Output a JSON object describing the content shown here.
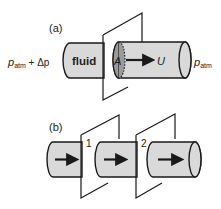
{
  "figure": {
    "panel_a": {
      "label": "(a)",
      "left_pressure": {
        "symbol": "p",
        "subscript": "atm",
        "suffix": " + Δp"
      },
      "right_pressure": {
        "symbol": "p",
        "subscript": "atm"
      },
      "fluid_label": "fluid",
      "area_label": "A",
      "velocity_label": "U"
    },
    "panel_b": {
      "label": "(b)",
      "plane_labels": [
        "1",
        "2"
      ]
    },
    "colors": {
      "tube_fill": "#d9d9d9",
      "cross_section_fill": "#9a9a9a",
      "stroke": "#1a1a1a",
      "background": "#ffffff"
    }
  }
}
